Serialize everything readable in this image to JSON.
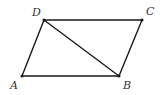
{
  "figure": {
    "type": "parallelogram",
    "name": "ABCD",
    "vertices": [
      {
        "id": "A",
        "label": "A",
        "x": 22,
        "y": 76,
        "label_x": 10,
        "label_y": 89
      },
      {
        "id": "B",
        "label": "B",
        "x": 119,
        "y": 76,
        "label_x": 123,
        "label_y": 89
      },
      {
        "id": "C",
        "label": "C",
        "x": 142,
        "y": 20,
        "label_x": 146,
        "label_y": 15
      },
      {
        "id": "D",
        "label": "D",
        "x": 44,
        "y": 20,
        "label_x": 32,
        "label_y": 16
      }
    ],
    "edges": [
      {
        "from": "A",
        "to": "B"
      },
      {
        "from": "B",
        "to": "C"
      },
      {
        "from": "C",
        "to": "D"
      },
      {
        "from": "D",
        "to": "A"
      },
      {
        "from": "D",
        "to": "B",
        "kind": "diagonal"
      }
    ],
    "colors": {
      "line": "#1a1a1a",
      "label": "#333333",
      "background": "#ffffff"
    }
  }
}
